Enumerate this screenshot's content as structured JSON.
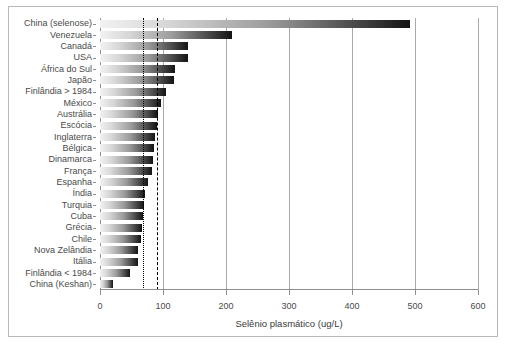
{
  "chart_data": {
    "type": "bar",
    "orientation": "horizontal",
    "title": "",
    "xlabel": "Selênio plasmático (ug/L)",
    "ylabel": "",
    "xlim": [
      0,
      600
    ],
    "xticks": [
      0,
      100,
      200,
      300,
      400,
      500,
      600
    ],
    "grid": true,
    "grid_axis": "x",
    "legend": null,
    "categories": [
      "China (selenose)",
      "Venezuela",
      "Canadá",
      "USA",
      "África do Sul",
      "Japão",
      "Finlândia > 1984",
      "México",
      "Austrália",
      "Escócia",
      "Inglaterra",
      "Bélgica",
      "Dinamarca",
      "França",
      "Espanha",
      "Índia",
      "Turquia",
      "Cuba",
      "Grécia",
      "Chile",
      "Nova Zelândia",
      "Itália",
      "Finlândia < 1984",
      "China (Keshan)"
    ],
    "values": [
      492,
      210,
      140,
      139,
      119,
      118,
      104,
      97,
      92,
      90,
      88,
      86,
      84,
      83,
      76,
      71,
      70,
      68,
      67,
      65,
      61,
      60,
      48,
      21
    ],
    "annotations": [
      {
        "name": "reference-line-dotted",
        "value": 68,
        "style": "dotted",
        "color": "#000000"
      },
      {
        "name": "reference-line-dashed",
        "value": 90,
        "style": "dashed",
        "color": "#000000"
      }
    ],
    "bar_gradient": [
      "#f2f2f2",
      "#d6d6d6",
      "#9a9a9a",
      "#4a4a4a",
      "#141414"
    ]
  },
  "axis": {
    "x_tick_labels": [
      "0",
      "100",
      "200",
      "300",
      "400",
      "500",
      "600"
    ],
    "x_axis_title": "Selênio plasmático (ug/L)"
  },
  "caption": {
    "text": ""
  }
}
